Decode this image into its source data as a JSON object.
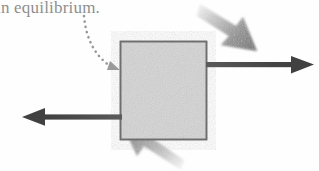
{
  "figure": {
    "caption": "in equilibrium.",
    "background_color": "#fefefe",
    "box": {
      "label": "body-box",
      "fill_color": "#d2d2d2",
      "border_color": "#707070",
      "x": 120,
      "y": 41,
      "width": 87,
      "height": 99
    },
    "pointer": {
      "name": "dotted-curved-arrow",
      "color": "#9a9a9a",
      "style": "dotted",
      "from_x": 84,
      "from_y": 16,
      "to_x": 118,
      "to_y": 70
    },
    "arrows": [
      {
        "name": "arrow-right",
        "direction": "right",
        "style": "solid",
        "color": "#4a4a4a",
        "from_x": 207,
        "from_y": 65,
        "to_x": 313,
        "to_y": 65
      },
      {
        "name": "arrow-left",
        "direction": "left",
        "style": "solid",
        "color": "#4a4a4a",
        "from_x": 120,
        "from_y": 117,
        "to_x": 27,
        "to_y": 117
      },
      {
        "name": "arrow-down-right-shaded",
        "direction": "down-right",
        "style": "airbrush",
        "color": "#9c9c9c",
        "from_x": 201,
        "from_y": 6,
        "to_x": 256,
        "to_y": 52
      },
      {
        "name": "arrow-up-left-shaded",
        "direction": "up-left",
        "style": "airbrush",
        "color": "#9c9c9c",
        "from_x": 178,
        "from_y": 168,
        "to_x": 93,
        "to_y": 124
      }
    ]
  }
}
